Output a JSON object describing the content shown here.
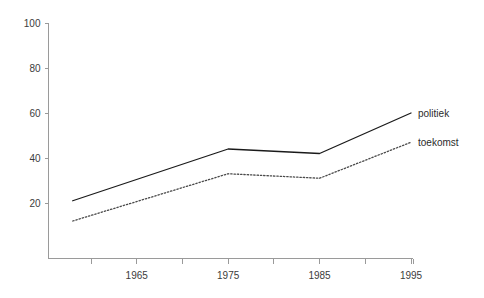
{
  "chart_data": {
    "type": "line",
    "title": "",
    "xlabel": "",
    "ylabel": "",
    "x": [
      1958,
      1975,
      1985,
      1995
    ],
    "xlim": [
      1956.5,
      1996.5
    ],
    "ylim": [
      0,
      100
    ],
    "yticks": [
      20,
      40,
      60,
      80,
      100
    ],
    "xticks": [
      1960,
      1965,
      1970,
      1975,
      1980,
      1985,
      1990,
      1995
    ],
    "xtick_labels": [
      "",
      "1965",
      "",
      "1975",
      "",
      "1985",
      "",
      "1995"
    ],
    "grid": false,
    "legend_position": "right-inline",
    "series": [
      {
        "name": "politiek",
        "style": "solid",
        "color": "#1a1a1a",
        "values": [
          21,
          44,
          42,
          60
        ]
      },
      {
        "name": "toekomst",
        "style": "dotted",
        "color": "#4a4a4a",
        "values": [
          12,
          33,
          31,
          47
        ]
      }
    ]
  },
  "axis": {
    "y_tick_labels": [
      "100",
      "80",
      "60",
      "40",
      "20"
    ],
    "x_tick_labels": [
      "1965",
      "1975",
      "1985",
      "1995"
    ]
  },
  "labels": {
    "politiek": "politiek",
    "toekomst": "toekomst"
  },
  "colors": {
    "axis": "#9a9a9a",
    "text": "#3c3c3c",
    "series_solid": "#1a1a1a",
    "series_dotted": "#4a4a4a",
    "background": "#ffffff"
  }
}
